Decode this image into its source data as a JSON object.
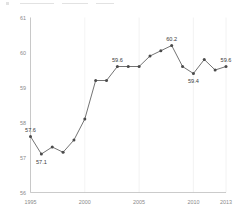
{
  "chart_data": {
    "type": "line",
    "title": "",
    "subtitle": "",
    "xlabel": "",
    "ylabel": "",
    "x": [
      1995,
      1996,
      1997,
      1998,
      1999,
      2000,
      2001,
      2002,
      2003,
      2004,
      2005,
      2006,
      2007,
      2008,
      2009,
      2010,
      2011,
      2012,
      2013
    ],
    "values": [
      57.6,
      57.1,
      57.3,
      57.15,
      57.5,
      58.1,
      59.2,
      59.2,
      59.6,
      59.6,
      59.6,
      59.9,
      60.05,
      60.2,
      59.6,
      59.4,
      59.8,
      59.5,
      59.6
    ],
    "series": [
      {
        "name": "",
        "values": [
          57.6,
          57.1,
          57.3,
          57.15,
          57.5,
          58.1,
          59.2,
          59.2,
          59.6,
          59.6,
          59.6,
          59.9,
          60.05,
          60.2,
          59.6,
          59.4,
          59.8,
          59.5,
          59.6
        ]
      }
    ],
    "ylim": [
      56,
      61
    ],
    "xlim": [
      1995,
      2013
    ],
    "yticks": [
      56,
      57,
      58,
      59,
      60,
      61
    ],
    "ytick_labels": [
      "56",
      "57",
      "58",
      "59",
      "60",
      "61"
    ],
    "xticks": [
      1995,
      2000,
      2005,
      2010,
      2013
    ],
    "xtick_labels": [
      "1995",
      "2000",
      "2005",
      "2010",
      "2013"
    ],
    "grid": "vertical-only",
    "legend": "none",
    "marker": "circle",
    "line_color": "#5a5a5a",
    "marker_color": "#4a4a4a",
    "grid_color": "#e9e9e9",
    "axis_color": "#b4b4b4",
    "tick_label_color": "#8a8a8a",
    "data_label_color": "#3b3b3b",
    "background_color": "#ffffff",
    "annotations": [
      {
        "x": 1995,
        "value": 57.6,
        "label": "57.6",
        "position": "above"
      },
      {
        "x": 1996,
        "value": 57.1,
        "label": "57.1",
        "position": "below"
      },
      {
        "x": 2003,
        "value": 59.6,
        "label": "59.6",
        "position": "above"
      },
      {
        "x": 2008,
        "value": 60.2,
        "label": "60.2",
        "position": "above"
      },
      {
        "x": 2010,
        "value": 59.4,
        "label": "59.4",
        "position": "below"
      },
      {
        "x": 2013,
        "value": 59.6,
        "label": "59.6",
        "position": "above"
      }
    ]
  }
}
